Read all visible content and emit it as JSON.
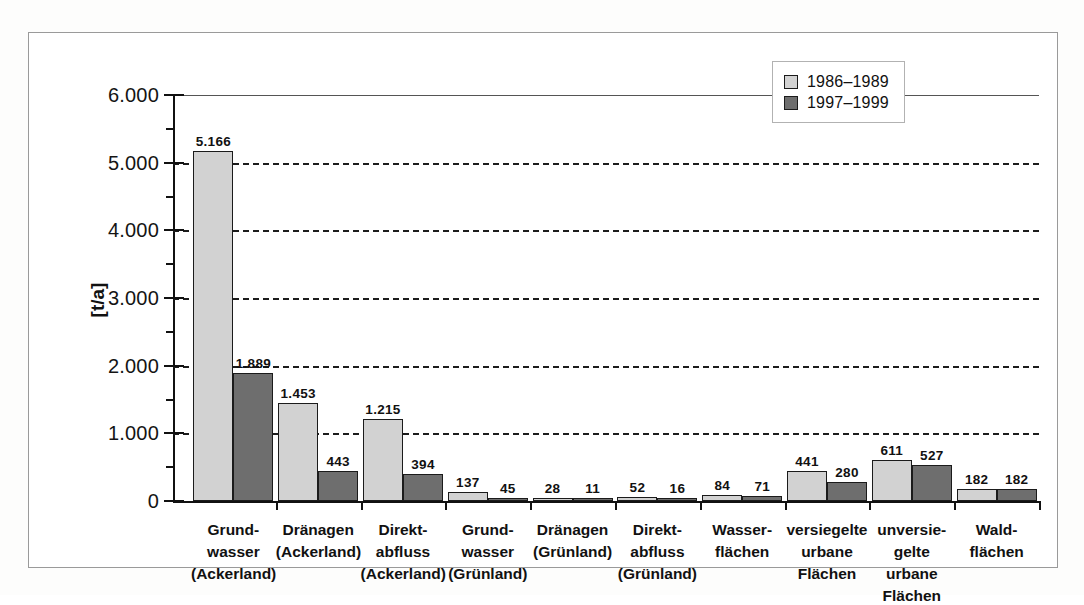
{
  "chart_data": {
    "type": "bar",
    "title": "",
    "xlabel": "",
    "ylabel": "[t/a]",
    "ylim": [
      0,
      6000
    ],
    "ytick_labels": [
      "0",
      "1.000",
      "2.000",
      "3.000",
      "4.000",
      "5.000",
      "6.000"
    ],
    "ytick_values": [
      0,
      1000,
      2000,
      3000,
      4000,
      5000,
      6000
    ],
    "grid": "horizontal-dashed",
    "legend_position": "top-right",
    "value_label_format": "german-thousands-dot",
    "categories": [
      "Grund-\nwasser\n(Ackerland)",
      "Dränagen\n(Ackerland)",
      "Direkt-\nabfluss\n(Ackerland)",
      "Grund-\nwasser\n(Grünland)",
      "Dränagen\n(Grünland)",
      "Direkt-\nabfluss\n(Grünland)",
      "Wasser-\nflächen",
      "versiegelte\nurbane\nFlächen",
      "unversie-\ngelte urbane\nFlächen",
      "Wald-\nflächen"
    ],
    "series": [
      {
        "name": "1986–1989",
        "color": "#d2d2d2",
        "values": [
          5166,
          1453,
          1215,
          137,
          28,
          52,
          84,
          441,
          611,
          182
        ],
        "labels": [
          "5.166",
          "1.453",
          "1.215",
          "137",
          "28",
          "52",
          "84",
          "441",
          "611",
          "182"
        ]
      },
      {
        "name": "1997–1999",
        "color": "#6e6e6e",
        "values": [
          1889,
          443,
          394,
          45,
          11,
          16,
          71,
          280,
          527,
          182
        ],
        "labels": [
          "1.889",
          "443",
          "394",
          "45",
          "11",
          "16",
          "71",
          "280",
          "527",
          "182"
        ]
      }
    ]
  },
  "legend": {
    "entries": [
      {
        "label": "1986–1989",
        "swatch": "light-gray-swatch"
      },
      {
        "label": "1997–1999",
        "swatch": "dark-gray-swatch"
      }
    ]
  },
  "colors": {
    "series_1986_1989": "#d2d2d2",
    "series_1997_1999": "#6e6e6e",
    "axis": "#111111",
    "gridline": "#1c1c1c",
    "frame": "#9a9a9a"
  }
}
